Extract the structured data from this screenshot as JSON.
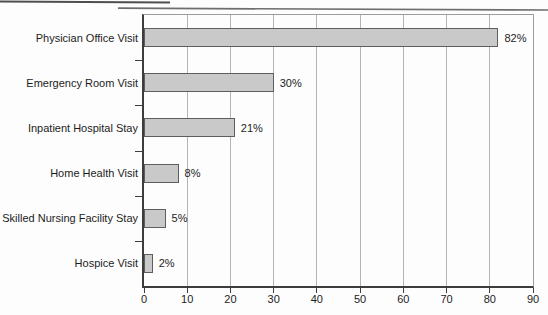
{
  "chart_data": {
    "type": "bar",
    "orientation": "horizontal",
    "title": "",
    "xlabel": "",
    "ylabel": "",
    "categories": [
      "Physician Office Visit",
      "Emergency Room Visit",
      "Inpatient Hospital Stay",
      "Home Health Visit",
      "Skilled Nursing Facility Stay",
      "Hospice Visit"
    ],
    "values": [
      82,
      30,
      21,
      8,
      5,
      2
    ],
    "value_labels": [
      "82%",
      "30%",
      "21%",
      "8%",
      "5%",
      "2%"
    ],
    "x_ticks": [
      0,
      10,
      20,
      30,
      40,
      50,
      60,
      70,
      80,
      90
    ],
    "x_tick_labels": [
      "0",
      "10",
      "20",
      "30",
      "40",
      "50",
      "60",
      "70",
      "80",
      "90"
    ],
    "xlim": [
      0,
      90
    ],
    "grid": true,
    "legend": "none",
    "colors": {
      "bar_fill": "#c9c9c9",
      "bar_border": "#5e5e5e",
      "gridline": "#b4b4b4",
      "axis": "#3d3d3d",
      "frame": "#9c9c9c",
      "text": "#1c1c1c",
      "background": "#fdfdfd"
    }
  }
}
